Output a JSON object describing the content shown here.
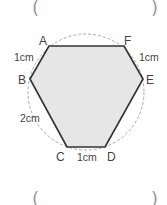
{
  "answer_top": {
    "open": "(",
    "close": ")"
  },
  "answer_bottom": {
    "open": "(",
    "close": ")"
  },
  "figure": {
    "type": "hexagon inscribed in circle",
    "vertices": {
      "A": "A",
      "B": "B",
      "C": "C",
      "D": "D",
      "E": "E",
      "F": "F"
    },
    "measurements": {
      "AB": "1cm",
      "FE": "1cm",
      "BC": "2cm",
      "CD": "1cm"
    },
    "colors": {
      "fill": "#e6e6e6",
      "stroke": "#333333",
      "circle": "#aaaaaa"
    }
  }
}
